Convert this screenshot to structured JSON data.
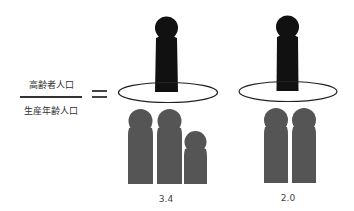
{
  "formula": {
    "numerator": "高齢者人口",
    "denominator": "生産年齢人口",
    "equals_sign": "="
  },
  "colors": {
    "elderly": "#111111",
    "working_age": "#555555",
    "ellipse_stroke": "#222222"
  },
  "groups": [
    {
      "elderly_count": 1,
      "working_figures": 3,
      "partial_last_figure": true,
      "ratio_label": "3.4"
    },
    {
      "elderly_count": 1,
      "working_figures": 2,
      "partial_last_figure": false,
      "ratio_label": "2.0"
    }
  ]
}
